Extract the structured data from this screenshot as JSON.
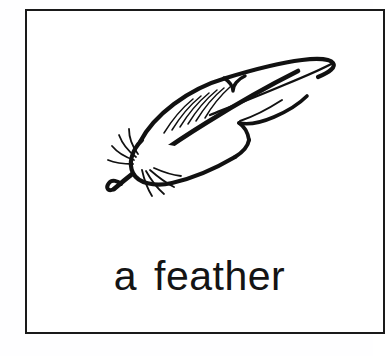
{
  "card": {
    "caption_article": "a",
    "caption_word": "feather",
    "caption_full": "a feather",
    "border_color": "#1a1a1a",
    "background_color": "#ffffff",
    "ink_color": "#141414",
    "page_background": "#fefeff"
  },
  "illustration": {
    "subject": "feather",
    "style": "black-and-white pen line drawing",
    "description": "A single quill feather drawn in outline, tilted with the calamus (hollow shaft tip) at the lower left and the pointed vane sweeping up to the right; short wispy barb strokes fan out around the shaft near the quill tip and a few fine parallel hatch strokes shade the upper vane.",
    "stroke_color": "#111111",
    "fill_color": "#ffffff",
    "hatch_stroke_count": 6,
    "barb_wisp_count": 8
  }
}
